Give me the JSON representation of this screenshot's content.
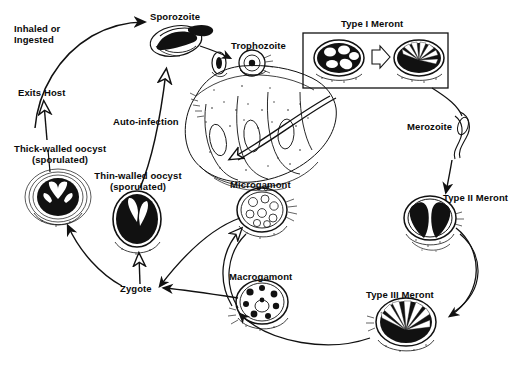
{
  "figure": {
    "type": "biological-life-cycle-diagram",
    "background_color": "#ffffff",
    "ink_color": "#111111",
    "style": "black-and-white pen-and-ink scientific illustration"
  },
  "labels": {
    "inhaled_or_ingested": "Inhaled or\nIngested",
    "exits_host": "Exits Host",
    "sporozoite": "Sporozoite",
    "auto_infection": "Auto-infection",
    "thick_walled_oocyst": "Thick-walled oocyst\n(sporulated)",
    "thin_walled_oocyst": "Thin-walled oocyst\n(sporulated)",
    "zygote": "Zygote",
    "trophozoite": "Trophozoite",
    "type_i_meront": "Type I Meront",
    "merozoite": "Merozoite",
    "type_ii_meront": "Type II Meront",
    "type_iii_meront": "Type III Meront",
    "microgamont": "Microgamont",
    "macrogamont": "Macrogamont"
  },
  "stages": [
    {
      "id": "sporozoite",
      "label": "Sporozoite",
      "order": 1
    },
    {
      "id": "trophozoite",
      "label": "Trophozoite",
      "order": 2
    },
    {
      "id": "type-i-meront",
      "label": "Type I Meront",
      "order": 3
    },
    {
      "id": "merozoite",
      "label": "Merozoite",
      "order": 4
    },
    {
      "id": "type-ii-meront",
      "label": "Type II Meront",
      "order": 5
    },
    {
      "id": "type-iii-meront",
      "label": "Type III Meront",
      "order": 6
    },
    {
      "id": "macrogamont",
      "label": "Macrogamont",
      "order": 7
    },
    {
      "id": "microgamont",
      "label": "Microgamont",
      "order": 8
    },
    {
      "id": "zygote",
      "label": "Zygote",
      "order": 9
    },
    {
      "id": "thin-walled-oocyst",
      "label": "Thin-walled oocyst (sporulated)",
      "order": 10
    },
    {
      "id": "thick-walled-oocyst",
      "label": "Thick-walled oocyst (sporulated)",
      "order": 11
    }
  ],
  "pathways": [
    {
      "id": "exits-host",
      "label": "Exits Host",
      "from": "thick-walled-oocyst",
      "to": "environment"
    },
    {
      "id": "inhaled-or-ingested",
      "label": "Inhaled or Ingested",
      "from": "environment",
      "to": "sporozoite"
    },
    {
      "id": "auto-infection",
      "label": "Auto-infection",
      "from": "thin-walled-oocyst",
      "to": "sporozoite"
    }
  ],
  "boxes": [
    {
      "id": "type-i-meront-box",
      "label": "Type I Meront",
      "contains": "two meront illustrations with transition arrow"
    }
  ]
}
